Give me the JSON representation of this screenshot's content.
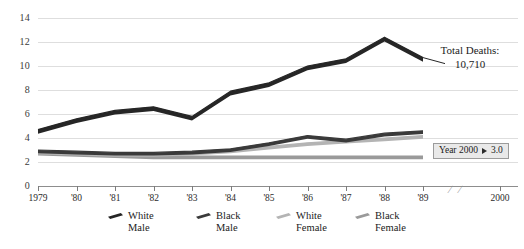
{
  "chart_data": {
    "type": "line",
    "title": "",
    "xlabel": "",
    "ylabel": "",
    "ylim": [
      0,
      14
    ],
    "yticks": [
      0,
      2,
      4,
      6,
      8,
      10,
      12,
      14
    ],
    "grid": true,
    "legend_position": "bottom",
    "axis_break_before_last_tick": true,
    "categories": [
      "1979",
      "'80",
      "'81",
      "'82",
      "'83",
      "'84",
      "'85",
      "'86",
      "'87",
      "'88",
      "'89",
      "2000"
    ],
    "x_tick_labels": [
      "1979",
      "'80",
      "'81",
      "'82",
      "'83",
      "'84",
      "'85",
      "'86",
      "'87",
      "'88",
      "'89",
      "2000"
    ],
    "series": [
      {
        "name": "White Male",
        "color": "#262626",
        "x": [
          "1979",
          "'80",
          "'81",
          "'82",
          "'83",
          "'84",
          "'85",
          "'86",
          "'87",
          "'88",
          "'89"
        ],
        "values": [
          4.7,
          5.6,
          6.3,
          6.6,
          5.8,
          7.9,
          8.6,
          10.0,
          10.6,
          12.4,
          10.7
        ]
      },
      {
        "name": "Black Male",
        "color": "#3a3a3a",
        "x": [
          "1979",
          "'80",
          "'81",
          "'82",
          "'83",
          "'84",
          "'85",
          "'86",
          "'87",
          "'88",
          "'89"
        ],
        "values": [
          3.0,
          2.9,
          2.8,
          2.8,
          2.9,
          3.1,
          3.6,
          4.2,
          3.9,
          4.4,
          4.6
        ]
      },
      {
        "name": "White Female",
        "color": "#b4b4b4",
        "x": [
          "1979",
          "'80",
          "'81",
          "'82",
          "'83",
          "'84",
          "'85",
          "'86",
          "'87",
          "'88",
          "'89"
        ],
        "values": [
          2.9,
          2.8,
          2.7,
          2.7,
          2.8,
          3.0,
          3.3,
          3.6,
          3.8,
          4.0,
          4.2
        ]
      },
      {
        "name": "Black Female",
        "color": "#9a9a9a",
        "x": [
          "1979",
          "'80",
          "'81",
          "'82",
          "'83",
          "'84",
          "'85",
          "'86",
          "'87",
          "'88",
          "'89"
        ],
        "values": [
          2.8,
          2.7,
          2.6,
          2.5,
          2.5,
          2.5,
          2.5,
          2.5,
          2.5,
          2.5,
          2.5
        ]
      }
    ],
    "annotations": [
      {
        "name": "total-deaths",
        "line1": "Total Deaths:",
        "line2": "10,710"
      },
      {
        "name": "year-2000-projection",
        "label": "Year 2000",
        "marker": "▶",
        "value": "3.0"
      }
    ]
  },
  "legend": {
    "items": [
      {
        "label_line1": "White",
        "label_line2": "Male",
        "color": "#262626"
      },
      {
        "label_line1": "Black",
        "label_line2": "Male",
        "color": "#3a3a3a"
      },
      {
        "label_line1": "White",
        "label_line2": "Female",
        "color": "#b4b4b4"
      },
      {
        "label_line1": "Black",
        "label_line2": "Female",
        "color": "#9a9a9a"
      }
    ]
  },
  "axis_break_glyph": "/ /"
}
